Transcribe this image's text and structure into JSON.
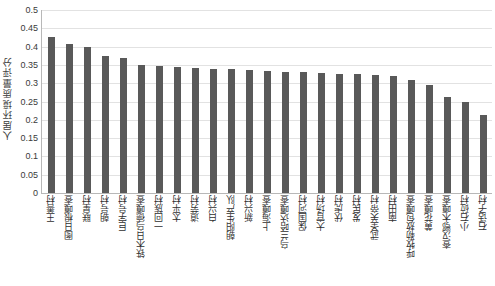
{
  "chart_data": {
    "type": "bar",
    "title": "",
    "xlabel": "",
    "ylabel": "人居环境质量评分",
    "ylim": [
      0,
      0.5
    ],
    "grid": true,
    "legend": "none",
    "y_ticks": [
      "0",
      "0.05",
      "0.1",
      "0.15",
      "0.2",
      "0.25",
      "0.3",
      "0.35",
      "0.4",
      "0.45",
      "0.5"
    ],
    "y_tick_values": [
      0,
      0.05,
      0.1,
      0.15,
      0.2,
      0.25,
      0.3,
      0.35,
      0.4,
      0.45,
      0.5
    ],
    "bar_color": "#595959",
    "grid_color": "#e2e2e2",
    "axis_color": "#b8b8b8",
    "categories": [
      "王善村",
      "图日根嘎查",
      "联星村",
      "朝号村",
      "巨字号村",
      "铁木日乌德嘎查",
      "一回族村",
      "太平村",
      "道劳村",
      "白兴村",
      "朝阳生产队",
      "新兴村",
      "上海嘎查",
      "乌兰哈达嘎查",
      "保国河村",
      "大官场村",
      "伏虎村",
      "发民村",
      "武圣关帝村",
      "南田村",
      "呼牧勒敖包嘎查",
      "黄花嘎查",
      "查汉鄂木嘎查",
      "小石砬村",
      "石话子村"
    ],
    "values": [
      0.425,
      0.408,
      0.4,
      0.375,
      0.37,
      0.35,
      0.348,
      0.344,
      0.342,
      0.34,
      0.338,
      0.336,
      0.334,
      0.332,
      0.33,
      0.328,
      0.326,
      0.324,
      0.322,
      0.32,
      0.31,
      0.296,
      0.262,
      0.25,
      0.212
    ]
  }
}
